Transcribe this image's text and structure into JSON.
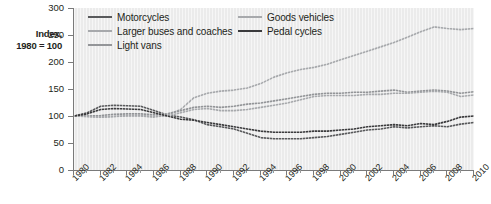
{
  "axis_title_line1": "Index,",
  "axis_title_line2": "1980 = 100",
  "legend": [
    {
      "label": "Motorcycles",
      "color": "#58595b",
      "col": 1,
      "row": 1
    },
    {
      "label": "Larger buses and coaches",
      "color": "#a7a9ac",
      "col": 1,
      "row": 2
    },
    {
      "label": "Light vans",
      "color": "#939598",
      "col": 1,
      "row": 3
    },
    {
      "label": "Goods vehicles",
      "color": "#a7a9ac",
      "col": 2,
      "row": 1
    },
    {
      "label": "Pedal cycles",
      "color": "#3b3b3d",
      "col": 2,
      "row": 2
    }
  ],
  "chart_data": {
    "type": "line",
    "title": "",
    "xlabel": "",
    "ylabel": "Index, 1980 = 100",
    "ylim": [
      0,
      300
    ],
    "ytick_values": [
      0,
      50,
      100,
      150,
      200,
      250,
      300
    ],
    "ytick_labels": [
      "0",
      "50",
      "100",
      "150",
      "200",
      "250",
      "300"
    ],
    "xlim": [
      1980,
      2010
    ],
    "xtick_values": [
      1980,
      1982,
      1984,
      1986,
      1988,
      1990,
      1992,
      1994,
      1996,
      1998,
      2000,
      2002,
      2004,
      2006,
      2008,
      2010
    ],
    "xtick_labels": [
      "1980",
      "1982",
      "1984",
      "1986",
      "1988",
      "1990",
      "1992",
      "1994",
      "1996",
      "1998",
      "2000",
      "2002",
      "2004",
      "2006",
      "2008",
      "2010"
    ],
    "grid": false,
    "legend_position": "top-inside",
    "x": [
      1980,
      1981,
      1982,
      1983,
      1984,
      1985,
      1986,
      1987,
      1988,
      1989,
      1990,
      1991,
      1992,
      1993,
      1994,
      1995,
      1996,
      1997,
      1998,
      1999,
      2000,
      2001,
      2002,
      2003,
      2004,
      2005,
      2006,
      2007,
      2008,
      2009,
      2010
    ],
    "series": [
      {
        "name": "Motorcycles",
        "color": "#58595b",
        "values": [
          100,
          106,
          118,
          120,
          119,
          118,
          110,
          102,
          98,
          93,
          84,
          80,
          76,
          68,
          60,
          58,
          58,
          58,
          60,
          62,
          66,
          70,
          74,
          76,
          80,
          78,
          80,
          82,
          80,
          85,
          88
        ]
      },
      {
        "name": "Larger buses and coaches",
        "color": "#a7a9ac",
        "values": [
          100,
          99,
          98,
          99,
          100,
          100,
          98,
          102,
          112,
          134,
          142,
          146,
          148,
          152,
          160,
          172,
          180,
          186,
          190,
          196,
          204,
          212,
          220,
          228,
          236,
          246,
          256,
          265,
          262,
          260,
          262
        ]
      },
      {
        "name": "Light vans",
        "color": "#939598",
        "values": [
          100,
          100,
          101,
          103,
          104,
          104,
          102,
          104,
          110,
          116,
          118,
          116,
          118,
          122,
          124,
          128,
          132,
          136,
          140,
          142,
          142,
          144,
          144,
          146,
          148,
          144,
          146,
          148,
          146,
          142,
          145
        ]
      },
      {
        "name": "Goods vehicles",
        "color": "#a7a9ac",
        "values": [
          100,
          99,
          98,
          99,
          101,
          101,
          99,
          100,
          106,
          112,
          114,
          110,
          110,
          112,
          116,
          120,
          124,
          130,
          136,
          138,
          138,
          138,
          140,
          140,
          142,
          142,
          144,
          146,
          144,
          136,
          139
        ]
      },
      {
        "name": "Pedal cycles",
        "color": "#3b3b3d",
        "values": [
          100,
          104,
          112,
          114,
          113,
          112,
          106,
          100,
          94,
          92,
          88,
          84,
          80,
          76,
          72,
          70,
          70,
          70,
          72,
          72,
          74,
          76,
          80,
          82,
          84,
          82,
          86,
          84,
          90,
          98,
          100
        ]
      }
    ]
  }
}
